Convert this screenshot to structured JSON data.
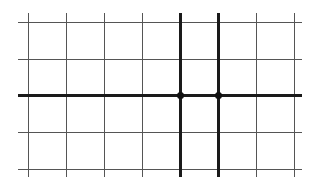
{
  "diagram": {
    "type": "grid-with-points",
    "width": 316,
    "height": 183,
    "background": "#ffffff",
    "grid": {
      "color": "#555555",
      "thin_width": 1,
      "bold_color": "#1a1a1a",
      "bold_width": 2.2,
      "x_extent": [
        18,
        302
      ],
      "y_extent": [
        13,
        177
      ],
      "vertical_lines": [
        {
          "x": 28,
          "bold": false
        },
        {
          "x": 66,
          "bold": false
        },
        {
          "x": 104,
          "bold": false
        },
        {
          "x": 142,
          "bold": false
        },
        {
          "x": 180,
          "bold": true
        },
        {
          "x": 218,
          "bold": true
        },
        {
          "x": 256,
          "bold": false
        },
        {
          "x": 294,
          "bold": false
        }
      ],
      "horizontal_lines": [
        {
          "y": 22,
          "bold": false
        },
        {
          "y": 59,
          "bold": false
        },
        {
          "y": 95,
          "bold": true
        },
        {
          "y": 132,
          "bold": false
        },
        {
          "y": 169,
          "bold": false
        }
      ]
    },
    "points": [
      {
        "x": 180,
        "y": 95,
        "r": 3.5,
        "color": "#111111"
      },
      {
        "x": 218,
        "y": 95,
        "r": 3.5,
        "color": "#111111"
      }
    ]
  }
}
